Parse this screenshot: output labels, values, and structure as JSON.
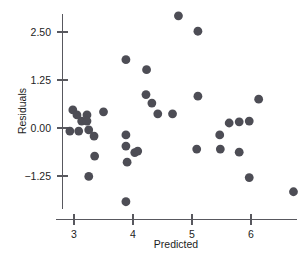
{
  "chart_data": {
    "type": "scatter",
    "title": "",
    "xlabel": "Predicted",
    "ylabel": "Residuals",
    "xlim": [
      2.72,
      6.92
    ],
    "ylim": [
      -2.12,
      3.02
    ],
    "xticks": [
      3,
      4,
      5,
      6
    ],
    "xticklabels": [
      "3",
      "4",
      "5",
      "6"
    ],
    "yticks": [
      2.5,
      1.25,
      0,
      -1.25
    ],
    "yticklabels": [
      "2.50",
      "1.25",
      "0.00",
      "-1.25"
    ],
    "grid": false,
    "legend": null,
    "marker": {
      "shape": "circle",
      "color": "#4d4d55",
      "size": 4.4
    },
    "points": [
      {
        "x": 2.98,
        "y": 0.47
      },
      {
        "x": 2.93,
        "y": -0.08
      },
      {
        "x": 3.08,
        "y": -0.08
      },
      {
        "x": 3.05,
        "y": 0.34
      },
      {
        "x": 3.13,
        "y": 0.18
      },
      {
        "x": 3.22,
        "y": 0.34
      },
      {
        "x": 3.22,
        "y": 0.18
      },
      {
        "x": 3.25,
        "y": -0.05
      },
      {
        "x": 3.25,
        "y": -1.26
      },
      {
        "x": 3.34,
        "y": -0.21
      },
      {
        "x": 3.35,
        "y": -0.73
      },
      {
        "x": 3.5,
        "y": 0.42
      },
      {
        "x": 3.88,
        "y": 1.78
      },
      {
        "x": 3.88,
        "y": -0.18
      },
      {
        "x": 3.88,
        "y": -0.47
      },
      {
        "x": 3.9,
        "y": -0.89
      },
      {
        "x": 3.88,
        "y": -1.92
      },
      {
        "x": 4.03,
        "y": -0.64
      },
      {
        "x": 4.08,
        "y": -0.6
      },
      {
        "x": 4.23,
        "y": 1.52
      },
      {
        "x": 4.22,
        "y": 0.87
      },
      {
        "x": 4.32,
        "y": 0.65
      },
      {
        "x": 4.42,
        "y": 0.37
      },
      {
        "x": 4.67,
        "y": 0.37
      },
      {
        "x": 4.77,
        "y": 2.92
      },
      {
        "x": 5.1,
        "y": 2.52
      },
      {
        "x": 5.1,
        "y": 0.83
      },
      {
        "x": 5.08,
        "y": -0.55
      },
      {
        "x": 5.47,
        "y": -0.18
      },
      {
        "x": 5.48,
        "y": -0.55
      },
      {
        "x": 5.63,
        "y": 0.13
      },
      {
        "x": 5.8,
        "y": 0.16
      },
      {
        "x": 5.8,
        "y": -0.63
      },
      {
        "x": 5.97,
        "y": 0.18
      },
      {
        "x": 5.97,
        "y": -1.29
      },
      {
        "x": 6.13,
        "y": 0.75
      },
      {
        "x": 6.72,
        "y": -1.66
      }
    ]
  },
  "axes": {
    "x_axis_name": "x-axis",
    "y_axis_name": "y-axis"
  }
}
